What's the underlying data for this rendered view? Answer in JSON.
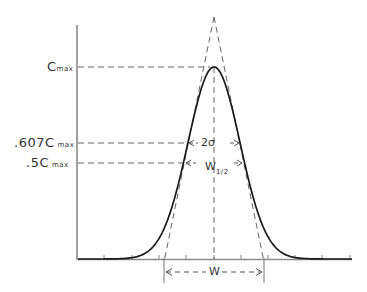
{
  "diagram": {
    "title": "",
    "y_labels": {
      "cmax": {
        "main": "C",
        "sub": "max"
      },
      "c607": {
        "main": ".607C",
        "sub": "max"
      },
      "c5": {
        "main": ".5C",
        "sub": "max"
      }
    },
    "annotations": {
      "two_sigma": "2σ",
      "half_width": {
        "main": "W",
        "sub": "1/2"
      },
      "base_width": "W"
    },
    "levels": {
      "cmax_fraction": 1.0,
      "sigma_level_fraction": 0.607,
      "half_level_fraction": 0.5
    },
    "colors": {
      "curve": "#1a1a1a",
      "axis": "#777777",
      "dashed": "#555555",
      "text": "#333333"
    }
  }
}
